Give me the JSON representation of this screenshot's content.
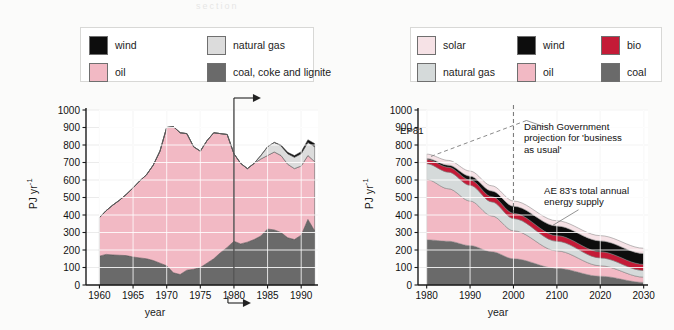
{
  "figure": {
    "background": "#f4f3f1",
    "panel_background": "#fbfbfa",
    "smudge_text": "section"
  },
  "colors": {
    "wind": "#0d0d0d",
    "oil": "#f2b9c4",
    "natural_gas": "#dcdcdc",
    "natural_gas_right": "#d5dada",
    "coal": "#6a6a6a",
    "solar": "#f6e2e6",
    "bio": "#c41b37",
    "gridline": "#ffffff",
    "axis": "#1a1a1a",
    "outline": "#6f6f6f",
    "plot_bg": "#ffffff"
  },
  "left": {
    "legend": {
      "items": [
        {
          "key": "wind",
          "label": "wind",
          "color": "#0d0d0d"
        },
        {
          "key": "natural_gas",
          "label": "natural gas",
          "color": "#dcdcdc"
        },
        {
          "key": "oil",
          "label": "oil",
          "color": "#f2b9c4"
        },
        {
          "key": "coal",
          "label": "coal, coke and lignite",
          "color": "#6a6a6a"
        }
      ]
    },
    "axis": {
      "ylabel": "PJ yr",
      "ylabel_exp": "-1",
      "xlabel": "year",
      "yticks": [
        0,
        100,
        200,
        300,
        400,
        500,
        600,
        700,
        800,
        900,
        1000
      ],
      "xticks": [
        1960,
        1965,
        1970,
        1975,
        1980,
        1985,
        1990
      ],
      "ylim": [
        0,
        1000
      ],
      "xlim": [
        1958,
        1992.5
      ]
    },
    "annotations": [
      {
        "name": "vertical-marker-1980",
        "text": ""
      },
      {
        "name": "top-arrow",
        "text": ""
      },
      {
        "name": "bottom-arrow",
        "text": ""
      }
    ]
  },
  "right": {
    "legend": {
      "items": [
        {
          "key": "solar",
          "label": "solar",
          "color": "#f6e2e6"
        },
        {
          "key": "wind",
          "label": "wind",
          "color": "#0d0d0d"
        },
        {
          "key": "bio",
          "label": "bio",
          "color": "#c41b37"
        },
        {
          "key": "natural_gas",
          "label": "natural gas",
          "color": "#d5dada"
        },
        {
          "key": "oil",
          "label": "oil",
          "color": "#f2b9c4"
        },
        {
          "key": "coal",
          "label": "coal",
          "color": "#6a6a6a"
        }
      ]
    },
    "axis": {
      "ylabel": "PJ yr",
      "ylabel_exp": "-1",
      "xlabel": "year",
      "yticks": [
        0,
        100,
        200,
        300,
        400,
        500,
        600,
        700,
        800,
        900,
        1000
      ],
      "xticks": [
        1980,
        1990,
        2000,
        2100,
        2020,
        2030
      ],
      "ylim": [
        0,
        1000
      ],
      "xlim": [
        1978,
        2031
      ]
    },
    "annotations": {
      "ep81": "EP81",
      "gov": "Danish Government\nprojection for 'business\nas usual'",
      "ae83": "AE 83's total annual\nenergy supply"
    }
  },
  "chart_data": [
    {
      "type": "area",
      "id": "left-historic-energy-supply",
      "title": "",
      "xlabel": "year",
      "ylabel": "PJ yr-1",
      "xlim": [
        1958,
        1992.5
      ],
      "ylim": [
        0,
        1000
      ],
      "grid": true,
      "legend_position": "above-plot",
      "stack_order": [
        "coal",
        "oil",
        "natural gas",
        "wind"
      ],
      "x": [
        1960,
        1961,
        1962,
        1963,
        1964,
        1965,
        1966,
        1967,
        1968,
        1969,
        1970,
        1971,
        1972,
        1973,
        1974,
        1975,
        1976,
        1977,
        1978,
        1979,
        1980,
        1981,
        1982,
        1983,
        1984,
        1985,
        1986,
        1987,
        1988,
        1989,
        1990,
        1991,
        1992
      ],
      "series": [
        {
          "name": "coal, coke and lignite",
          "color": "#6a6a6a",
          "values": [
            165,
            175,
            172,
            170,
            168,
            160,
            155,
            150,
            140,
            125,
            110,
            70,
            60,
            85,
            90,
            100,
            125,
            150,
            185,
            215,
            250,
            235,
            245,
            260,
            280,
            320,
            315,
            300,
            270,
            260,
            285,
            375,
            310
          ]
        },
        {
          "name": "oil",
          "color": "#f2b9c4",
          "values": [
            220,
            250,
            285,
            315,
            350,
            395,
            440,
            480,
            545,
            640,
            790,
            835,
            810,
            780,
            700,
            665,
            700,
            720,
            680,
            645,
            500,
            460,
            420,
            435,
            440,
            420,
            445,
            440,
            420,
            405,
            395,
            365,
            395
          ]
        },
        {
          "name": "natural gas",
          "color": "#dcdcdc",
          "values": [
            0,
            0,
            0,
            0,
            0,
            0,
            0,
            0,
            0,
            0,
            0,
            0,
            0,
            0,
            0,
            0,
            0,
            0,
            0,
            0,
            0,
            0,
            0,
            0,
            20,
            50,
            55,
            55,
            60,
            65,
            70,
            75,
            85
          ]
        },
        {
          "name": "wind",
          "color": "#0d0d0d",
          "values": [
            0,
            0,
            0,
            0,
            0,
            0,
            0,
            0,
            0,
            0,
            0,
            0,
            0,
            0,
            0,
            0,
            0,
            0,
            0,
            0,
            0,
            0,
            0,
            0,
            0,
            0,
            0,
            5,
            8,
            10,
            12,
            15,
            18
          ]
        }
      ],
      "totals": [
        385,
        425,
        457,
        485,
        518,
        555,
        595,
        630,
        685,
        765,
        900,
        905,
        870,
        865,
        790,
        765,
        825,
        870,
        865,
        860,
        750,
        695,
        665,
        695,
        740,
        790,
        815,
        800,
        758,
        740,
        762,
        830,
        808
      ]
    },
    {
      "type": "area",
      "id": "right-ae83-scenario",
      "title": "",
      "xlabel": "year",
      "ylabel": "PJ yr-1",
      "xlim": [
        1978,
        2031
      ],
      "ylim": [
        0,
        1000
      ],
      "grid": true,
      "legend_position": "above-plot",
      "stack_order": [
        "coal",
        "oil",
        "natural gas",
        "bio",
        "wind",
        "solar"
      ],
      "x": [
        1980,
        1985,
        1990,
        1995,
        2000,
        2010,
        2020,
        2030
      ],
      "series": [
        {
          "name": "coal",
          "color": "#6a6a6a",
          "values": [
            258,
            250,
            225,
            190,
            150,
            95,
            50,
            15
          ]
        },
        {
          "name": "oil",
          "color": "#f2b9c4",
          "values": [
            345,
            300,
            255,
            205,
            160,
            100,
            60,
            30
          ]
        },
        {
          "name": "natural gas",
          "color": "#d5dada",
          "values": [
            90,
            95,
            90,
            80,
            70,
            55,
            45,
            38
          ]
        },
        {
          "name": "bio",
          "color": "#c41b37",
          "values": [
            25,
            28,
            30,
            30,
            30,
            32,
            35,
            35
          ]
        },
        {
          "name": "wind",
          "color": "#0d0d0d",
          "values": [
            5,
            12,
            22,
            32,
            40,
            55,
            62,
            62
          ]
        },
        {
          "name": "solar",
          "color": "#f6e2e6",
          "values": [
            25,
            27,
            29,
            30,
            30,
            30,
            30,
            30
          ]
        }
      ],
      "totals": [
        748,
        712,
        651,
        567,
        480,
        367,
        282,
        210
      ],
      "reference_lines": [
        {
          "name": "EP81",
          "style": "dashed",
          "color": "#8a8a8a",
          "x": [
            1980,
            2000
          ],
          "y": [
            740,
            1000
          ]
        },
        {
          "name": "2000 marker",
          "style": "dashed-vertical",
          "x": 2000
        }
      ]
    }
  ]
}
